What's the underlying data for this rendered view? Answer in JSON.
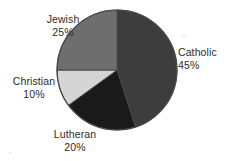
{
  "chart_data": {
    "type": "pie",
    "title": "",
    "categories": [
      "Catholic",
      "Lutheran",
      "Christian",
      "Jewish"
    ],
    "values": [
      45,
      20,
      10,
      25
    ],
    "value_unit": "%",
    "labels": [
      {
        "name": "Catholic",
        "value": "45%",
        "percent": 45,
        "color": "#3d3d3d"
      },
      {
        "name": "Lutheran",
        "value": "20%",
        "percent": 20,
        "color": "#1a1a1a"
      },
      {
        "name": "Christian",
        "value": "10%",
        "percent": 10,
        "color": "#d5d5d5"
      },
      {
        "name": "Jewish",
        "value": "25%",
        "percent": 25,
        "color": "#6e6e6e"
      }
    ],
    "start_angle": 0,
    "direction": "clockwise",
    "legend": "none",
    "labels_position": "outside",
    "background": "#ffffff",
    "outline_color": "#4a4a4a"
  }
}
